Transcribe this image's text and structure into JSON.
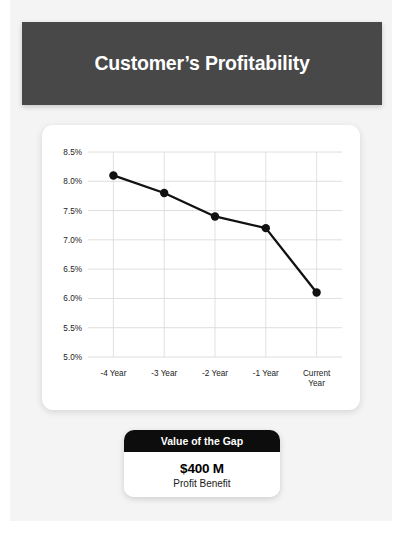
{
  "header": {
    "title": "Customer’s Profitability"
  },
  "gap_card": {
    "header_label": "Value of the Gap",
    "value": "$400 M",
    "caption": "Profit Benefit"
  },
  "colors": {
    "slide_background": "#f4f4f4",
    "header_bar": "#484848",
    "header_text": "#ffffff",
    "card_background": "#ffffff",
    "line": "#111111",
    "gridline": "#d6d6d6",
    "gap_card_header": "#0d0d0d"
  },
  "chart_data": {
    "type": "line",
    "title": "",
    "xlabel": "",
    "ylabel": "",
    "categories": [
      "-4 Year",
      "-3 Year",
      "-2 Year",
      "-1 Year",
      "Current\nYear"
    ],
    "x_tick_labels": [
      [
        "-4 Year"
      ],
      [
        "-3 Year"
      ],
      [
        "-2 Year"
      ],
      [
        "-1 Year"
      ],
      [
        "Current",
        "Year"
      ]
    ],
    "values": [
      8.1,
      7.8,
      7.4,
      7.2,
      6.1
    ],
    "value_labels": [
      "8.1%",
      "7.8%",
      "7.4%",
      "7.2%",
      "6.1%"
    ],
    "ylim": [
      5.0,
      8.5
    ],
    "y_ticks": [
      5.0,
      5.5,
      6.0,
      6.5,
      7.0,
      7.5,
      8.0,
      8.5
    ],
    "y_tick_labels": [
      "5.0%",
      "5.5%",
      "6.0%",
      "6.5%",
      "7.0%",
      "7.5%",
      "8.0%",
      "8.5%"
    ],
    "grid": true,
    "legend": false,
    "markers": true,
    "series": [
      {
        "name": "Profitability",
        "values": [
          8.1,
          7.8,
          7.4,
          7.2,
          6.1
        ]
      }
    ]
  }
}
